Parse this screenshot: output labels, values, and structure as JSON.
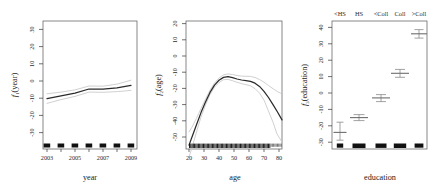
{
  "figure": {
    "type": "multi-panel-partial-effect-plot",
    "panel_count": 3,
    "background": "#ffffff",
    "line_color": "#2b2b2b",
    "se_color": "#c4c4c4"
  },
  "chart_data": [
    {
      "type": "line",
      "panel_index": 0,
      "title": "",
      "xlabel": "year",
      "ylabel": "f_1(year)",
      "ylabel_base": "f",
      "ylabel_sub": "1",
      "ylabel_arg": "(year)",
      "xlim": [
        2003,
        2009
      ],
      "ylim": [
        -38,
        33
      ],
      "xticks": [
        2003,
        2005,
        2007,
        2009
      ],
      "xtick_labels": [
        "2003",
        "2005",
        "2007",
        "2009"
      ],
      "yticks": [
        -30,
        -20,
        -10,
        0,
        10,
        20,
        30
      ],
      "ytick_labels": [
        "-30",
        "-20",
        "-10",
        "0",
        "10",
        "20",
        "30"
      ],
      "grid": false,
      "legend": "none",
      "x": [
        2003,
        2004,
        2005,
        2006,
        2007,
        2008,
        2009
      ],
      "values": [
        -4.2,
        -2.6,
        -1.0,
        1.4,
        1.3,
        2.1,
        3.6
      ],
      "series": [
        {
          "name": "fit",
          "values": [
            -4.2,
            -2.6,
            -1.0,
            1.4,
            1.3,
            2.1,
            3.6
          ]
        },
        {
          "name": "upper_se",
          "values": [
            -1.4,
            -0.4,
            0.9,
            3.2,
            3.1,
            4.3,
            6.6
          ]
        },
        {
          "name": "lower_se",
          "values": [
            -7.0,
            -4.8,
            -2.9,
            -0.4,
            -0.5,
            -0.1,
            0.6
          ]
        }
      ],
      "rug_values": [
        2003,
        2004,
        2005,
        2006,
        2007,
        2008,
        2009
      ]
    },
    {
      "type": "line",
      "panel_index": 1,
      "title": "",
      "xlabel": "age",
      "ylabel": "f_2(age)",
      "ylabel_base": "f",
      "ylabel_sub": "2",
      "ylabel_arg": "(age)",
      "xlim": [
        18,
        81
      ],
      "ylim": [
        -57,
        22
      ],
      "xticks": [
        20,
        30,
        40,
        50,
        60,
        70,
        80
      ],
      "xtick_labels": [
        "20",
        "30",
        "40",
        "50",
        "60",
        "70",
        "80"
      ],
      "yticks": [
        -50,
        -40,
        -30,
        -20,
        -10,
        0,
        10,
        20
      ],
      "ytick_labels": [
        "-50",
        "-40",
        "-30",
        "-20",
        "-10",
        "0",
        "10",
        "20"
      ],
      "grid": false,
      "legend": "none",
      "x": [
        18,
        20,
        23,
        26,
        29,
        32,
        35,
        38,
        41,
        44,
        47,
        50,
        53,
        56,
        59,
        62,
        65,
        68,
        71,
        74,
        77,
        80
      ],
      "values": [
        -35.0,
        -30.0,
        -22.5,
        -15.0,
        -8.5,
        -2.5,
        2.0,
        5.0,
        6.8,
        7.2,
        6.6,
        5.8,
        5.2,
        4.8,
        4.4,
        3.2,
        1.2,
        -1.8,
        -5.6,
        -10.0,
        -14.6,
        -19.5
      ],
      "series": [
        {
          "name": "fit",
          "values": [
            -35.0,
            -30.0,
            -22.5,
            -15.0,
            -8.5,
            -2.5,
            2.0,
            5.0,
            6.8,
            7.2,
            6.6,
            5.8,
            5.2,
            4.8,
            4.4,
            3.2,
            1.2,
            -1.8,
            -5.6,
            -10.0,
            -14.6,
            -19.5
          ]
        },
        {
          "name": "upper_se",
          "values": [
            -27.0,
            -24.0,
            -18.5,
            -12.5,
            -6.8,
            -1.2,
            3.2,
            6.3,
            8.2,
            8.8,
            8.4,
            7.8,
            7.4,
            7.3,
            7.2,
            6.5,
            5.3,
            3.6,
            1.6,
            -0.4,
            -2.2,
            -3.6
          ]
        },
        {
          "name": "lower_se",
          "values": [
            -43.0,
            -36.5,
            -26.8,
            -17.6,
            -10.2,
            -3.8,
            0.8,
            3.7,
            5.4,
            5.6,
            4.8,
            3.8,
            3.0,
            2.3,
            1.6,
            -0.1,
            -2.9,
            -7.2,
            -12.8,
            -19.6,
            -27.0,
            -35.4
          ]
        }
      ],
      "rug_dense": true,
      "rug_range": [
        18,
        80
      ]
    },
    {
      "type": "scatter",
      "panel_index": 2,
      "title": "",
      "xlabel": "education",
      "ylabel": "f_3(education)",
      "ylabel_base": "f",
      "ylabel_sub": "3",
      "ylabel_arg": "(education)",
      "ylim": [
        -34,
        44
      ],
      "yticks": [
        -30,
        -20,
        -10,
        0,
        10,
        20,
        30,
        40
      ],
      "ytick_labels": [
        "-30",
        "-20",
        "-10",
        "0",
        "10",
        "20",
        "30",
        "40"
      ],
      "grid": false,
      "legend": "none",
      "categories": [
        "<HS",
        "HS",
        "<Coll",
        "Coll",
        ">Coll"
      ],
      "values": [
        -24.0,
        -15.0,
        -3.0,
        12.0,
        36.0
      ],
      "upper_se": [
        -18.5,
        -13.2,
        -1.0,
        14.4,
        38.6
      ],
      "lower_se": [
        -29.5,
        -16.8,
        -5.2,
        9.6,
        33.4
      ],
      "rug_weights": [
        0.35,
        1.0,
        0.7,
        0.8,
        0.55
      ]
    }
  ]
}
